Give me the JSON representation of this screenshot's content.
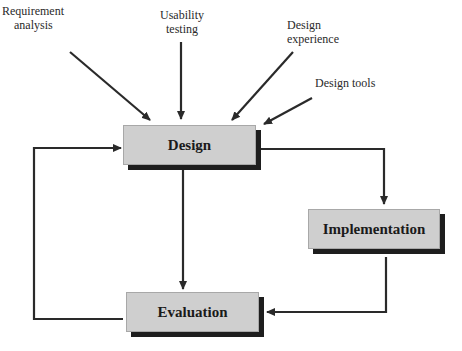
{
  "inputs": [
    {
      "id": "requirement-analysis",
      "label_lines": [
        "Requirement",
        "analysis"
      ]
    },
    {
      "id": "usability-testing",
      "label_lines": [
        "Usability",
        "testing"
      ]
    },
    {
      "id": "design-experience",
      "label_lines": [
        "Design",
        "experience"
      ]
    },
    {
      "id": "design-tools",
      "label_lines": [
        "Design tools"
      ]
    }
  ],
  "nodes": {
    "design": "Design",
    "implementation": "Implementation",
    "evaluation": "Evaluation"
  },
  "edges": [
    {
      "from": "Requirement analysis",
      "to": "Design"
    },
    {
      "from": "Usability testing",
      "to": "Design"
    },
    {
      "from": "Design experience",
      "to": "Design"
    },
    {
      "from": "Design tools",
      "to": "Design"
    },
    {
      "from": "Design",
      "to": "Implementation"
    },
    {
      "from": "Design",
      "to": "Evaluation"
    },
    {
      "from": "Implementation",
      "to": "Evaluation"
    },
    {
      "from": "Evaluation",
      "to": "Design"
    }
  ],
  "colors": {
    "box_fill": "#cfcfcf",
    "box_shadow": "#1e1e1e",
    "line": "#2a2a2a"
  }
}
